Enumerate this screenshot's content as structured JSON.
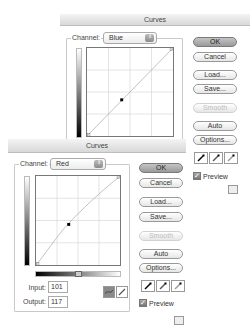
{
  "back_dialog": {
    "title": "Curves",
    "channel_label": "Channel:",
    "channel_value": "Blue",
    "buttons": {
      "ok": "OK",
      "cancel": "Cancel",
      "load": "Load...",
      "save": "Save...",
      "smooth": "Smooth",
      "auto": "Auto",
      "options": "Options..."
    },
    "preview_label": "Preview",
    "preview_checked": true,
    "curve": {
      "points": [
        [
          0,
          0
        ],
        [
          101,
          101
        ],
        [
          255,
          255
        ]
      ]
    }
  },
  "front_dialog": {
    "title": "Curves",
    "channel_label": "Channel:",
    "channel_value": "Red",
    "input_label": "Input:",
    "input_value": "101",
    "output_label": "Output:",
    "output_value": "117",
    "buttons": {
      "ok": "OK",
      "cancel": "Cancel",
      "load": "Load...",
      "save": "Save...",
      "smooth": "Smooth",
      "auto": "Auto",
      "options": "Options..."
    },
    "preview_label": "Preview",
    "preview_checked": true,
    "curve": {
      "points": [
        [
          0,
          0
        ],
        [
          101,
          117
        ],
        [
          255,
          255
        ]
      ]
    }
  },
  "icons": {
    "select_arrows": "⇕",
    "checkmark": "✓"
  },
  "colors": {
    "default_button": "#a8a8a8",
    "curve_line": "#999999",
    "grid_line": "#d0d0d0"
  }
}
